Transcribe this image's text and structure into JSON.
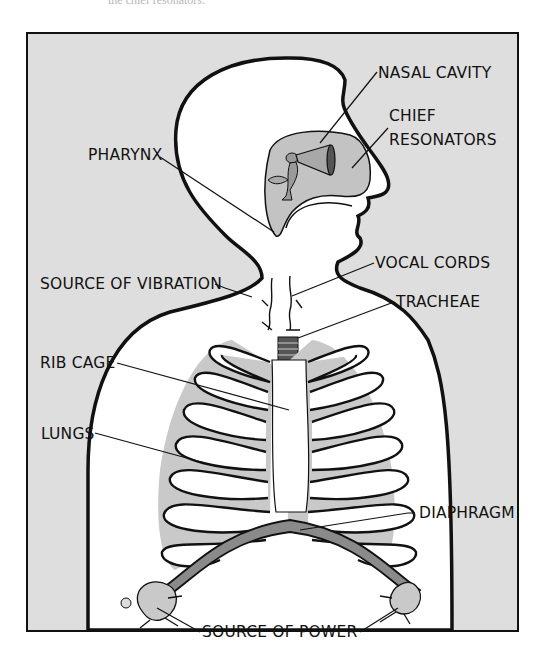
{
  "top_caption_fragment": "the chief resonators.",
  "figure": {
    "colors": {
      "background": "#dedede",
      "body_fill": "#ffffff",
      "outline": "#111111",
      "lung_fill": "#c9c9c9",
      "diaphragm_fill": "#8a8a8a"
    }
  },
  "labels": {
    "nasal_cavity": "NASAL CAVITY",
    "chief": "CHIEF",
    "resonators": "RESONATORS",
    "pharynx": "PHARYNX",
    "vocal_cords": "VOCAL CORDS",
    "source_of_vibration": "SOURCE OF VIBRATION",
    "tracheae": "TRACHEAE",
    "rib_cage": "RIB CAGE",
    "lungs": "LUNGS",
    "diaphragm": "DIAPHRAGM",
    "source_of_power": "SOURCE OF POWER"
  }
}
